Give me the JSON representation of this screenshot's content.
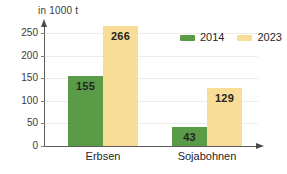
{
  "chart_data": {
    "type": "bar",
    "title": "",
    "subtitle": "",
    "xlabel": "",
    "ylabel": "in 1000 t",
    "unit_label": "in 1000 t",
    "categories": [
      "Erbsen",
      "Sojabohnen"
    ],
    "series": [
      {
        "name": "2014",
        "color": "#5a9b47",
        "values": [
          155,
          43
        ]
      },
      {
        "name": "2023",
        "color": "#f7dd96",
        "values": [
          266,
          129
        ]
      }
    ],
    "ylim": [
      0,
      270
    ],
    "yticks": [
      0,
      50,
      100,
      150,
      200,
      250
    ],
    "ytick_labels": [
      "0",
      "50",
      "100",
      "150",
      "200",
      "250"
    ],
    "grid": true,
    "grid_axis": "y",
    "legend_position": "top-right",
    "data_labels": [
      "155",
      "266",
      "43",
      "129"
    ],
    "annotations": []
  },
  "legend": {
    "items": [
      {
        "label": "2014",
        "color": "#5a9b47"
      },
      {
        "label": "2023",
        "color": "#f7dd96"
      }
    ]
  },
  "colors": {
    "series_2014": "#5a9b47",
    "series_2023": "#f7dd96",
    "axis": "#5b5b59",
    "grid": "#ececeb",
    "text": "#26261f",
    "background": "#ffffff"
  }
}
